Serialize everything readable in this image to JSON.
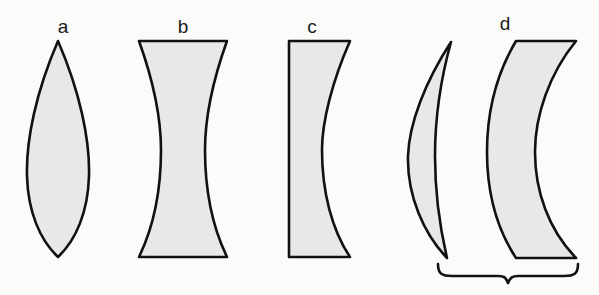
{
  "figure": {
    "background_color": "#fbfbfa",
    "fill_color": "#e8e8e6",
    "stroke_color": "#111111",
    "label_color": "#1a1a1a"
  },
  "labels": {
    "a": "a",
    "b": "b",
    "c": "c",
    "d": "d"
  },
  "lenses": [
    {
      "id": "a",
      "label": "a",
      "type": "biconvex",
      "description": "Biconvex lens: both surfaces curve outward, meeting at sharp points top and bottom.",
      "label_x": 63,
      "label_y": 33,
      "bounds": {
        "x": 25,
        "y": 40,
        "width": 65,
        "height": 218
      }
    },
    {
      "id": "b",
      "label": "b",
      "type": "biconcave",
      "description": "Biconcave lens: both surfaces curve inward, flat top and bottom edges.",
      "label_x": 183,
      "label_y": 33,
      "bounds": {
        "x": 138,
        "y": 40,
        "width": 90,
        "height": 218
      }
    },
    {
      "id": "c",
      "label": "c",
      "type": "plano-concave",
      "description": "Plano-concave lens: flat left surface, concave right surface.",
      "label_x": 312,
      "label_y": 33,
      "bounds": {
        "x": 288,
        "y": 40,
        "width": 62,
        "height": 218
      }
    },
    {
      "id": "d",
      "label": "d",
      "type": "meniscus-pair",
      "description": "Meniscus pair: a thin crescent element and a thicker curved element, braced together as one group.",
      "label_x": 505,
      "label_y": 30,
      "bounds": {
        "x": 404,
        "y": 40,
        "width": 175,
        "height": 218
      },
      "elements": [
        {
          "id": "d-left",
          "type": "crescent-meniscus"
        },
        {
          "id": "d-right",
          "type": "thick-meniscus"
        }
      ],
      "brace": {
        "x_start": 437,
        "x_end": 578,
        "y": 266
      }
    }
  ]
}
